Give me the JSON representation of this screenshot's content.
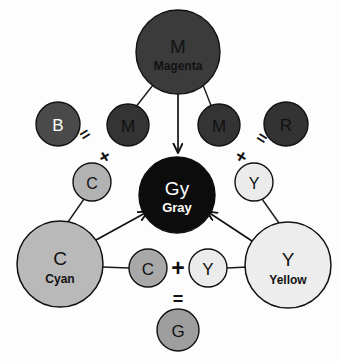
{
  "diagram": {
    "background_color": "#fdfdfd",
    "stroke_color": "#1a1a1a",
    "nodes": {
      "magenta_main": {
        "id": "magenta-main",
        "letter": "M",
        "name": "Magenta",
        "fill": "#3b3b3b",
        "text_color": "#111111",
        "cx": 178,
        "cy": 52,
        "r": 42
      },
      "magenta_left": {
        "id": "magenta-left",
        "letter": "M",
        "name": "",
        "fill": "#343434",
        "text_color": "#111111",
        "cx": 128,
        "cy": 125,
        "r": 21
      },
      "magenta_right": {
        "id": "magenta-right",
        "letter": "M",
        "name": "",
        "fill": "#343434",
        "text_color": "#111111",
        "cx": 219,
        "cy": 125,
        "r": 21
      },
      "blue": {
        "id": "blue",
        "letter": "B",
        "name": "",
        "fill": "#4a4a4a",
        "text_color": "#ffffff",
        "cx": 58,
        "cy": 124,
        "r": 22
      },
      "red": {
        "id": "red",
        "letter": "R",
        "name": "",
        "fill": "#333333",
        "text_color": "#111111",
        "cx": 286,
        "cy": 124,
        "r": 22
      },
      "cyan_small_upper": {
        "id": "cyan-small-upper",
        "letter": "C",
        "name": "",
        "fill": "#b2b2b2",
        "text_color": "#111111",
        "cx": 92,
        "cy": 182,
        "r": 19
      },
      "yellow_small_upper": {
        "id": "yellow-small-upper",
        "letter": "Y",
        "name": "",
        "fill": "#ebebeb",
        "text_color": "#111111",
        "cx": 254,
        "cy": 182,
        "r": 19
      },
      "gray": {
        "id": "gray",
        "letter": "Gy",
        "name": "Gray",
        "fill": "#0c0c0c",
        "text_color": "#ffffff",
        "cx": 177,
        "cy": 195,
        "r": 38
      },
      "cyan_main": {
        "id": "cyan-main",
        "letter": "C",
        "name": "Cyan",
        "fill": "#b9b9b9",
        "text_color": "#111111",
        "cx": 60,
        "cy": 264,
        "r": 43
      },
      "yellow_main": {
        "id": "yellow-main",
        "letter": "Y",
        "name": "Yellow",
        "fill": "#ededed",
        "text_color": "#111111",
        "cx": 288,
        "cy": 265,
        "r": 43
      },
      "cyan_small_lower": {
        "id": "cyan-small-lower",
        "letter": "C",
        "name": "",
        "fill": "#a8a8a8",
        "text_color": "#111111",
        "cx": 148,
        "cy": 268,
        "r": 19
      },
      "yellow_small_lower": {
        "id": "yellow-small-lower",
        "letter": "Y",
        "name": "",
        "fill": "#ebebeb",
        "text_color": "#111111",
        "cx": 208,
        "cy": 268,
        "r": 19
      },
      "green": {
        "id": "green",
        "letter": "G",
        "name": "",
        "fill": "#9e9e9e",
        "text_color": "#111111",
        "cx": 178,
        "cy": 330,
        "r": 21
      }
    },
    "operators": [
      {
        "id": "op-equals-left",
        "symbol": "=",
        "x": 88,
        "y": 139,
        "rotate": -32
      },
      {
        "id": "op-plus-left",
        "symbol": "+",
        "x": 108,
        "y": 160,
        "rotate": -32
      },
      {
        "id": "op-plus-right",
        "symbol": "+",
        "x": 238,
        "y": 160,
        "rotate": 32
      },
      {
        "id": "op-equals-right",
        "symbol": "=",
        "x": 258,
        "y": 141,
        "rotate": 32
      },
      {
        "id": "op-plus-bottom",
        "symbol": "+",
        "x": 178,
        "y": 268,
        "rotate": 0
      },
      {
        "id": "op-equals-bottom",
        "symbol": "=",
        "x": 178,
        "y": 299,
        "rotate": 0
      }
    ],
    "connectors": [
      {
        "id": "link-magenta-to-m-left",
        "from": "magenta_main",
        "to": "magenta_left"
      },
      {
        "id": "link-magenta-to-m-right",
        "from": "magenta_main",
        "to": "magenta_right"
      },
      {
        "id": "link-c-upper-to-cyan",
        "from": "cyan_small_upper",
        "to": "cyan_main"
      },
      {
        "id": "link-y-upper-to-yellow",
        "from": "yellow_small_upper",
        "to": "yellow_main"
      },
      {
        "id": "link-cyan-to-c-lower",
        "from": "cyan_main",
        "to": "cyan_small_lower"
      },
      {
        "id": "link-y-lower-to-yellow",
        "from": "yellow_small_lower",
        "to": "yellow_main"
      }
    ],
    "arrows": [
      {
        "id": "arrow-magenta-to-gray",
        "from": "magenta_main",
        "to": "gray"
      },
      {
        "id": "arrow-cyan-to-gray",
        "from": "cyan_main",
        "to": "gray"
      },
      {
        "id": "arrow-yellow-to-gray",
        "from": "yellow_main",
        "to": "gray"
      }
    ]
  }
}
